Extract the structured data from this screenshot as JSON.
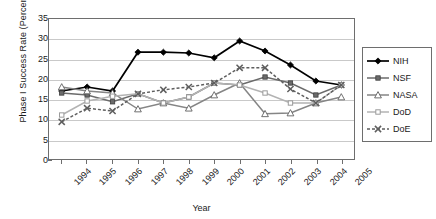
{
  "chart_data": {
    "type": "line",
    "title": "",
    "xlabel": "Year",
    "ylabel": "Phase I Success Rate (Percent)",
    "categories": [
      "1994",
      "1995",
      "1996",
      "1997",
      "1998",
      "1999",
      "2000",
      "2001",
      "2002",
      "2003",
      "2004",
      "2005"
    ],
    "ylim": [
      0,
      35
    ],
    "yticks": [
      0,
      5,
      10,
      15,
      20,
      25,
      30,
      35
    ],
    "grid": "horizontal",
    "legend_position": "right",
    "series": [
      {
        "name": "NIH",
        "color": "#000000",
        "marker": "filled-diamond",
        "linestyle": "solid",
        "values": [
          17.0,
          18.0,
          17.0,
          26.7,
          26.7,
          26.5,
          25.3,
          29.5,
          27.0,
          23.5,
          19.5,
          18.5
        ]
      },
      {
        "name": "NSF",
        "color": "#6b6b6b",
        "marker": "filled-square",
        "linestyle": "solid",
        "values": [
          16.5,
          16.0,
          14.3,
          16.3,
          14.0,
          15.5,
          19.0,
          18.5,
          20.5,
          19.0,
          16.0,
          18.5
        ]
      },
      {
        "name": "NASA",
        "color": "#858585",
        "marker": "open-triangle",
        "linestyle": "solid",
        "values": [
          18.0,
          17.0,
          16.5,
          12.5,
          14.0,
          12.7,
          16.0,
          19.0,
          11.3,
          11.5,
          14.0,
          15.5
        ]
      },
      {
        "name": "DoD",
        "color": "#b3b3b3",
        "marker": "open-square",
        "linestyle": "solid",
        "values": [
          11.0,
          14.5,
          15.7,
          16.3,
          14.0,
          15.5,
          19.0,
          18.5,
          16.5,
          14.0,
          14.0,
          18.5
        ]
      },
      {
        "name": "DoE",
        "color": "#5e5e5e",
        "marker": "cross-x",
        "linestyle": "dashed",
        "values": [
          9.3,
          12.7,
          12.0,
          16.3,
          17.3,
          18.0,
          19.0,
          22.8,
          22.8,
          17.5,
          14.0,
          18.5
        ]
      }
    ]
  },
  "legend": {
    "items": [
      {
        "label": "NIH"
      },
      {
        "label": "NSF"
      },
      {
        "label": "NASA"
      },
      {
        "label": "DoD"
      },
      {
        "label": "DoE"
      }
    ]
  }
}
